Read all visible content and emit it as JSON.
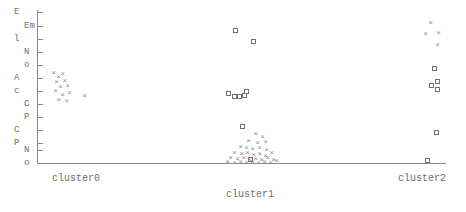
{
  "chart_data": {
    "type": "scatter",
    "title": "",
    "xlabel": "",
    "ylabel": "",
    "grid": false,
    "legend": "none",
    "categories": [
      "cluster0",
      "cluster1",
      "cluster2"
    ],
    "xtick_labels": [
      "cluster0",
      "cluster1",
      "cluster2"
    ],
    "ytick_labels": [
      "E",
      "Em",
      "l",
      "N",
      "o",
      "A",
      "c",
      "C",
      "P",
      "C",
      "P",
      "N",
      "o"
    ],
    "ytick_left_column": [
      "E",
      "l",
      "A",
      "c",
      "C",
      "P"
    ],
    "ytick_right_column": [
      "Em",
      "N",
      "o",
      "C",
      "P",
      "N",
      "o"
    ],
    "ylim": [
      0,
      1
    ],
    "xlim": [
      0,
      1
    ],
    "marker_types": [
      "square",
      "cross"
    ],
    "colors": {
      "axis": "#8a8a8a",
      "square_marker": "#707070",
      "cross_marker": "#8d8d8d",
      "text": "#6e6e6e",
      "background": "#ffffff"
    },
    "series": [
      {
        "name": "square",
        "marker": "square",
        "points": [
          {
            "x": 236,
            "y": 31
          },
          {
            "x": 254,
            "y": 42
          },
          {
            "x": 229,
            "y": 94
          },
          {
            "x": 235,
            "y": 97
          },
          {
            "x": 240,
            "y": 97
          },
          {
            "x": 245,
            "y": 96
          },
          {
            "x": 247,
            "y": 92
          },
          {
            "x": 243,
            "y": 127
          },
          {
            "x": 251,
            "y": 160
          },
          {
            "x": 435,
            "y": 69
          },
          {
            "x": 432,
            "y": 86
          },
          {
            "x": 438,
            "y": 82
          },
          {
            "x": 438,
            "y": 90
          },
          {
            "x": 437,
            "y": 133
          },
          {
            "x": 428,
            "y": 161
          }
        ]
      },
      {
        "name": "cross",
        "marker": "cross",
        "points": [
          {
            "x": 53,
            "y": 72
          },
          {
            "x": 58,
            "y": 76
          },
          {
            "x": 62,
            "y": 73
          },
          {
            "x": 56,
            "y": 81
          },
          {
            "x": 64,
            "y": 80
          },
          {
            "x": 60,
            "y": 86
          },
          {
            "x": 67,
            "y": 85
          },
          {
            "x": 55,
            "y": 90
          },
          {
            "x": 62,
            "y": 94
          },
          {
            "x": 69,
            "y": 92
          },
          {
            "x": 58,
            "y": 99
          },
          {
            "x": 66,
            "y": 100
          },
          {
            "x": 84,
            "y": 95
          },
          {
            "x": 255,
            "y": 133
          },
          {
            "x": 262,
            "y": 136
          },
          {
            "x": 248,
            "y": 140
          },
          {
            "x": 257,
            "y": 142
          },
          {
            "x": 265,
            "y": 141
          },
          {
            "x": 240,
            "y": 146
          },
          {
            "x": 246,
            "y": 147
          },
          {
            "x": 252,
            "y": 148
          },
          {
            "x": 259,
            "y": 147
          },
          {
            "x": 266,
            "y": 149
          },
          {
            "x": 234,
            "y": 152
          },
          {
            "x": 241,
            "y": 153
          },
          {
            "x": 247,
            "y": 152
          },
          {
            "x": 253,
            "y": 154
          },
          {
            "x": 259,
            "y": 153
          },
          {
            "x": 265,
            "y": 155
          },
          {
            "x": 271,
            "y": 152
          },
          {
            "x": 230,
            "y": 157
          },
          {
            "x": 237,
            "y": 158
          },
          {
            "x": 243,
            "y": 157
          },
          {
            "x": 249,
            "y": 159
          },
          {
            "x": 255,
            "y": 158
          },
          {
            "x": 261,
            "y": 159
          },
          {
            "x": 267,
            "y": 157
          },
          {
            "x": 273,
            "y": 159
          },
          {
            "x": 227,
            "y": 161
          },
          {
            "x": 234,
            "y": 162
          },
          {
            "x": 240,
            "y": 161
          },
          {
            "x": 246,
            "y": 162
          },
          {
            "x": 252,
            "y": 161
          },
          {
            "x": 258,
            "y": 162
          },
          {
            "x": 264,
            "y": 161
          },
          {
            "x": 270,
            "y": 162
          },
          {
            "x": 276,
            "y": 160
          },
          {
            "x": 430,
            "y": 22
          },
          {
            "x": 425,
            "y": 33
          },
          {
            "x": 438,
            "y": 32
          },
          {
            "x": 437,
            "y": 44
          }
        ]
      }
    ]
  },
  "yaxis": {
    "ticks": [
      {
        "y": 12,
        "left": "E",
        "right": ""
      },
      {
        "y": 26,
        "left": "",
        "right": "Em"
      },
      {
        "y": 39,
        "left": "l",
        "right": ""
      },
      {
        "y": 52,
        "left": "",
        "right": "N"
      },
      {
        "y": 65,
        "left": "",
        "right": "o"
      },
      {
        "y": 78,
        "left": "A",
        "right": ""
      },
      {
        "y": 91,
        "left": "c",
        "right": ""
      },
      {
        "y": 104,
        "left": "",
        "right": "C"
      },
      {
        "y": 117,
        "left": "",
        "right": "P"
      },
      {
        "y": 130,
        "left": "C",
        "right": ""
      },
      {
        "y": 143,
        "left": "P",
        "right": ""
      },
      {
        "y": 150,
        "left": "",
        "right": "N"
      },
      {
        "y": 163,
        "left": "",
        "right": "o"
      }
    ]
  },
  "xaxis": {
    "ticks": [
      {
        "x": 78,
        "label": "cluster0"
      },
      {
        "x": 252,
        "label": "cluster1"
      },
      {
        "x": 424,
        "label": "cluster2"
      }
    ]
  }
}
